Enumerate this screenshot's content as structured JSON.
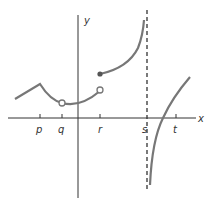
{
  "graph": {
    "axes": {
      "x_label": "x",
      "y_label": "y"
    },
    "ticks": [
      {
        "label": "p",
        "x": 40
      },
      {
        "label": "q",
        "x": 62
      },
      {
        "label": "r",
        "x": 100
      },
      {
        "label": "s",
        "x": 146
      },
      {
        "label": "t",
        "x": 176
      }
    ],
    "colors": {
      "axis": "#333333",
      "curve": "#777777",
      "asymptote": "#333333",
      "text": "#333333"
    },
    "features": {
      "corner_at": "p",
      "open_circle_at": [
        "q",
        "r"
      ],
      "filled_dot_at": "r",
      "vertical_asymptote_at": "s",
      "x_intercept_between": [
        "s",
        "t"
      ]
    }
  }
}
